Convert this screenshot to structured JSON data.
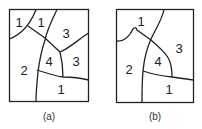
{
  "figures": [
    {
      "id": "a",
      "caption": "(a)",
      "regions": [
        {
          "label": "1",
          "x": 19,
          "y": 27
        },
        {
          "label": "1",
          "x": 41,
          "y": 27
        },
        {
          "label": "3",
          "x": 66,
          "y": 38
        },
        {
          "label": "4",
          "x": 49,
          "y": 66
        },
        {
          "label": "3",
          "x": 76,
          "y": 66
        },
        {
          "label": "2",
          "x": 24,
          "y": 75
        },
        {
          "label": "1",
          "x": 61,
          "y": 94
        }
      ]
    },
    {
      "id": "b",
      "caption": "(b)",
      "regions": [
        {
          "label": "1",
          "x": 141,
          "y": 26
        },
        {
          "label": "3",
          "x": 179,
          "y": 53
        },
        {
          "label": "4",
          "x": 158,
          "y": 66
        },
        {
          "label": "2",
          "x": 129,
          "y": 74
        },
        {
          "label": "1",
          "x": 169,
          "y": 94
        }
      ]
    }
  ]
}
